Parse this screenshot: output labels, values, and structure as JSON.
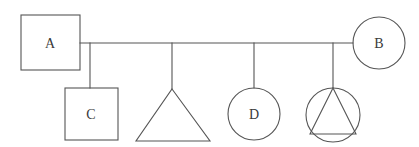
{
  "diagram": {
    "type": "pedigree-chart",
    "background_color": "#ffffff",
    "stroke_color": "#555555",
    "text_color": "#3a3a3a",
    "stroke_width": 1.1,
    "width": 419,
    "height": 147
  },
  "generations": {
    "parent_row_y": 43,
    "child_row_top_y": 88,
    "child_row_bottom_y": 141
  },
  "parents": [
    {
      "id": "A",
      "label": "A",
      "shape": "square",
      "role": "father",
      "x": 21,
      "y": 15,
      "width": 59,
      "height": 55,
      "label_x": 50,
      "label_y": 43
    },
    {
      "id": "B",
      "label": "B",
      "shape": "circle",
      "role": "mother",
      "cx": 379,
      "cy": 43,
      "r": 26,
      "label_x": 379,
      "label_y": 43
    }
  ],
  "children": [
    {
      "id": "C",
      "label": "C",
      "shape": "square",
      "x": 65,
      "y": 88,
      "width": 53,
      "height": 52,
      "label_x": 91,
      "label_y": 114,
      "drop_x": 90,
      "drop_from_y": 43,
      "drop_to_y": 88
    },
    {
      "id": "triangle-child",
      "label": "",
      "shape": "triangle",
      "apex_x": 172,
      "apex_y": 89,
      "base_left_x": 136,
      "base_right_x": 210,
      "base_y": 141,
      "label_x": 172,
      "label_y": 125,
      "drop_x": 172,
      "drop_from_y": 43,
      "drop_to_y": 89
    },
    {
      "id": "D",
      "label": "D",
      "shape": "circle",
      "cx": 254,
      "cy": 114,
      "r": 26,
      "label_x": 254,
      "label_y": 114,
      "drop_x": 254,
      "drop_from_y": 43,
      "drop_to_y": 88
    },
    {
      "id": "triangle-in-circle-child",
      "label": "",
      "shape": "triangle-in-circle",
      "cx": 333,
      "cy": 115,
      "r": 27,
      "apex_x": 333,
      "apex_y": 88,
      "base_left_x": 310,
      "base_right_x": 356,
      "base_y": 134,
      "label_x": 333,
      "label_y": 120,
      "drop_x": 333,
      "drop_from_y": 43,
      "drop_to_y": 88
    }
  ],
  "sibship_line": {
    "from_x": 80,
    "to_x": 353,
    "y": 43
  }
}
